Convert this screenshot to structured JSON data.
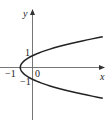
{
  "chart_data": {
    "type": "line",
    "title": "",
    "equation": "x = y^2 - 1",
    "xlabel": "x",
    "ylabel": "y",
    "tick_labels": {
      "x": [
        "-1",
        "0"
      ],
      "y": [
        "1",
        "-1"
      ]
    },
    "series": [
      {
        "name": "parabola",
        "points": [
          [
            5.76,
            -2.6
          ],
          [
            3.84,
            -2.2
          ],
          [
            2.24,
            -1.8
          ],
          [
            0.96,
            -1.4
          ],
          [
            0.0,
            -1.0
          ],
          [
            -0.64,
            -0.6
          ],
          [
            -0.96,
            -0.2
          ],
          [
            -1.0,
            0.0
          ],
          [
            -0.96,
            0.2
          ],
          [
            -0.64,
            0.6
          ],
          [
            0.0,
            1.0
          ],
          [
            0.96,
            1.4
          ],
          [
            2.24,
            1.8
          ],
          [
            3.84,
            2.2
          ],
          [
            5.76,
            2.6
          ]
        ]
      }
    ],
    "xlim": [
      -2.6,
      6.0
    ],
    "ylim": [
      -4.3,
      4.8
    ],
    "grid": false,
    "legend": "none",
    "colors": {
      "axis": "#555555",
      "curve": "#222222"
    }
  },
  "labels": {
    "x_axis": "x",
    "y_axis": "y",
    "x_tick_neg1": "−1",
    "origin": "0",
    "y_tick_pos1": "1",
    "y_tick_neg1": "−1"
  }
}
